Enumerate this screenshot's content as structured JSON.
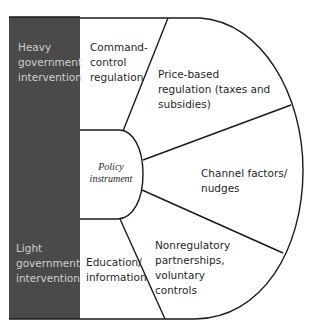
{
  "diagram": {
    "center": {
      "label": "Policy\ninstrument"
    },
    "axis": {
      "top_label": "Heavy\ngovernment\nintervention",
      "bottom_label": "Light\ngovernment\nintervention"
    },
    "segments": [
      {
        "label": "Command-\ncontrol\nregulation"
      },
      {
        "label": "Price-based\nregulation (taxes and\nsubsidies)"
      },
      {
        "label": "Channel factors/\nnudges"
      },
      {
        "label": "Nonregulatory\npartnerships,\nvoluntary\ncontrols"
      },
      {
        "label": "Education/\ninformation"
      }
    ],
    "colors": {
      "bar_fill": "#4a4a4a",
      "line": "#1a1a1a",
      "bar_text": "#cfcfcf",
      "text": "#1f1f1f"
    }
  }
}
